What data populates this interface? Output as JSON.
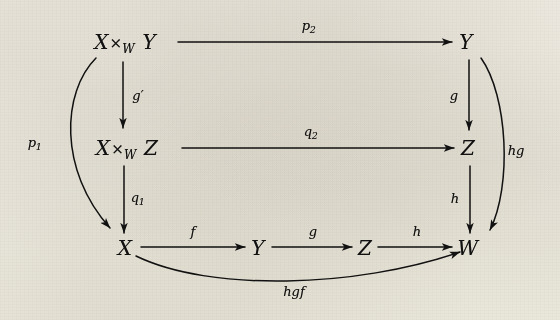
{
  "figure": {
    "kind": "commutative-diagram",
    "background_color": "#efece4",
    "ink_color": "#111111",
    "nodes": [
      {
        "id": "xwy_top",
        "text": "X ×W Y",
        "base": "X",
        "times": "×",
        "sub": "W",
        "tail": "Y",
        "x": 125,
        "y": 42
      },
      {
        "id": "y_top",
        "text": "Y",
        "x": 466,
        "y": 42
      },
      {
        "id": "xwz_mid",
        "text": "X ×W Z",
        "base": "X",
        "times": "×",
        "sub": "W",
        "tail": "Z",
        "x": 127,
        "y": 148
      },
      {
        "id": "z_mid",
        "text": "Z",
        "x": 468,
        "y": 148
      },
      {
        "id": "x_bot",
        "text": "X",
        "x": 125,
        "y": 248
      },
      {
        "id": "y_bot",
        "text": "Y",
        "x": 258,
        "y": 248
      },
      {
        "id": "z_bot",
        "text": "Z",
        "x": 365,
        "y": 248
      },
      {
        "id": "w_bot",
        "text": "W",
        "x": 468,
        "y": 248
      }
    ],
    "arrow_labels": [
      {
        "id": "p2",
        "base": "p",
        "sub": "2",
        "x": 309,
        "y": 25,
        "from": "xwy_top",
        "to": "y_top"
      },
      {
        "id": "q2",
        "base": "q",
        "sub": "2",
        "x": 311,
        "y": 131,
        "from": "xwz_mid",
        "to": "z_mid"
      },
      {
        "id": "gp",
        "base": "g′",
        "sub": "",
        "x": 138,
        "y": 95,
        "from": "xwy_top",
        "to": "xwz_mid"
      },
      {
        "id": "q1",
        "base": "q",
        "sub": "1",
        "x": 138,
        "y": 197,
        "from": "xwz_mid",
        "to": "x_bot"
      },
      {
        "id": "g_r",
        "base": "g",
        "sub": "",
        "x": 454,
        "y": 95,
        "from": "y_top",
        "to": "z_mid"
      },
      {
        "id": "h_r",
        "base": "h",
        "sub": "",
        "x": 455,
        "y": 198,
        "from": "z_mid",
        "to": "w_bot"
      },
      {
        "id": "f",
        "base": "f",
        "sub": "",
        "x": 193,
        "y": 231,
        "from": "x_bot",
        "to": "y_bot"
      },
      {
        "id": "g_b",
        "base": "g",
        "sub": "",
        "x": 313,
        "y": 231,
        "from": "y_bot",
        "to": "z_bot"
      },
      {
        "id": "h_b",
        "base": "h",
        "sub": "",
        "x": 417,
        "y": 231,
        "from": "z_bot",
        "to": "w_bot"
      },
      {
        "id": "p1",
        "base": "p",
        "sub": "1",
        "x": 35,
        "y": 142,
        "from": "xwy_top",
        "to": "x_bot"
      },
      {
        "id": "hg",
        "base": "hg",
        "sub": "",
        "x": 516,
        "y": 150,
        "from": "y_top",
        "to": "w_bot"
      },
      {
        "id": "hgf",
        "base": "hgf",
        "sub": "",
        "x": 294,
        "y": 291,
        "from": "x_bot",
        "to": "w_bot"
      }
    ]
  }
}
